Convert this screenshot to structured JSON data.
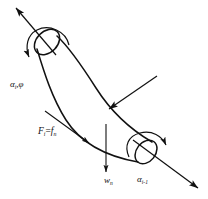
{
  "figure": {
    "kind": "engineering-diagram",
    "background_color": "#ffffff",
    "stroke_color": "#111111",
    "width": 208,
    "height": 199
  },
  "labels": {
    "alpha_i_phi": {
      "symbol": "α",
      "subscript": "i",
      "separator": ",",
      "second_symbol": "φ",
      "full_text": "αi,φ"
    },
    "force": {
      "symbol": "F",
      "subscript": "i",
      "operator": "=",
      "second_symbol": "f",
      "second_subscript": "n",
      "full_text": "Fi=fn"
    },
    "weight": {
      "symbol": "w",
      "subscript": "n",
      "full_text": "wn"
    },
    "alpha_i_minus_1": {
      "symbol": "α",
      "subscript": "i-1",
      "full_text": "αi-1"
    }
  },
  "annotations": {
    "top_axial_arrow": "axial direction arrow at upper end",
    "bottom_axial_arrow": "axial direction arrow at lower end",
    "top_rotation_arc": "rotation arc at upper end",
    "bottom_rotation_arc": "rotation arc at lower end",
    "load_arrow": "diagonal load arrow onto tube body",
    "tangential_arrow": "tangential force arrow along tube edge",
    "vertical_arrow": "downward vertical load arrow"
  }
}
